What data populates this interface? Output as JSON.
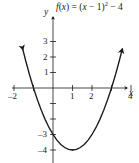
{
  "figure": {
    "width": 139,
    "height": 163,
    "background_color": "#ffffff",
    "ink_color": "#1a1a1a"
  },
  "equation": {
    "full_text": "f(x) = (x - 1)^2 - 4",
    "fx": "f",
    "paren_x_open": "(",
    "var_x": "x",
    "paren_x_close": ")",
    "equals": " = (",
    "var_x2": "x",
    "minus_one": " − 1)",
    "exponent": "2",
    "minus_four": " − 4"
  },
  "axes": {
    "x_label": "x",
    "y_label": "y",
    "origin_px": {
      "x": 53,
      "y": 88
    },
    "x_scale_px_per_unit": 19.5,
    "y_scale_px_per_unit": 15.5,
    "x_ticks": [
      {
        "value": -2,
        "label": "–2",
        "px": 14
      },
      {
        "value": -1,
        "label": "",
        "px": 33.5
      },
      {
        "value": 1,
        "label": "1",
        "px": 72.5
      },
      {
        "value": 2,
        "label": "2",
        "px": 92
      },
      {
        "value": 3,
        "label": "",
        "px": 111.5
      },
      {
        "value": 4,
        "label": "4",
        "px": 131
      }
    ],
    "y_ticks": [
      {
        "value": 3,
        "label": "3",
        "px": 41.5
      },
      {
        "value": 2,
        "label": "2",
        "px": 57
      },
      {
        "value": 1,
        "label": "1",
        "px": 72.5
      },
      {
        "value": -1,
        "label": "",
        "px": 103.5
      },
      {
        "value": -2,
        "label": "",
        "px": 119
      },
      {
        "value": -3,
        "label": "–3",
        "px": 134.5
      },
      {
        "value": -4,
        "label": "–4",
        "px": 150
      }
    ]
  },
  "chart_data": {
    "type": "line",
    "xlabel": "x",
    "ylabel": "y",
    "xlim": [
      -2.2,
      4.4
    ],
    "ylim": [
      -4.6,
      3.8
    ],
    "grid": false,
    "legend": "none",
    "function": "f(x) = (x - 1)^2 - 4",
    "vertex": [
      1,
      -4
    ],
    "x_intercepts": [
      -1,
      3
    ],
    "y_intercept": [
      0,
      -3
    ],
    "series": [
      {
        "name": "f(x) = (x - 1)^2 - 4",
        "color": "#1a1a1a",
        "x": [
          -1.55,
          -1.4,
          -1.2,
          -1.0,
          -0.8,
          -0.6,
          -0.4,
          -0.2,
          0.0,
          0.2,
          0.4,
          0.6,
          0.8,
          1.0,
          1.2,
          1.4,
          1.6,
          1.8,
          2.0,
          2.2,
          2.4,
          2.6,
          2.8,
          3.0,
          3.2,
          3.4,
          3.55
        ],
        "y": [
          2.5025,
          1.76,
          0.84,
          0.0,
          -0.76,
          -1.44,
          -2.04,
          -2.56,
          -3.0,
          -3.36,
          -3.64,
          -3.84,
          -3.96,
          -4.0,
          -3.96,
          -3.84,
          -3.64,
          -3.36,
          -3.0,
          -2.56,
          -2.04,
          -1.44,
          -0.76,
          0.0,
          0.84,
          1.76,
          2.5025
        ]
      }
    ],
    "arrowheads": [
      "left-branch-up",
      "right-branch-up",
      "x-axis-right",
      "y-axis-up"
    ]
  },
  "tick_labels": {
    "x_neg2": "–2",
    "x_1": "1",
    "x_2": "2",
    "x_4": "4",
    "y_3": "3",
    "y_2": "2",
    "y_1": "1",
    "y_neg3": "–3",
    "y_neg4": "–4"
  }
}
